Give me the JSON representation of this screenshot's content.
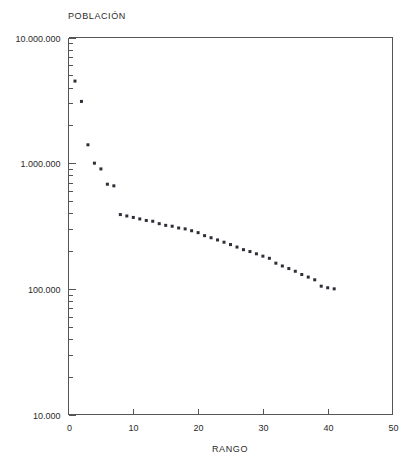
{
  "chart_data": {
    "type": "scatter",
    "title": "",
    "ylabel": "POBLACIÓN",
    "xlabel": "RANGO",
    "yscale": "log",
    "xscale": "linear",
    "xlim": [
      0,
      50
    ],
    "ylim": [
      10000,
      10000000
    ],
    "grid": false,
    "legend": null,
    "x_ticks": [
      0,
      10,
      20,
      30,
      40,
      50
    ],
    "x_tick_labels": [
      "0",
      "10",
      "20",
      "30",
      "40",
      "50"
    ],
    "y_ticks": [
      10000,
      100000,
      1000000,
      10000000
    ],
    "y_tick_labels": [
      "10.000",
      "100.000",
      "1.000.000",
      "10.000.000"
    ],
    "y_minor_ticks_per_decade": [
      2,
      3,
      4,
      5,
      6,
      7,
      8,
      9
    ],
    "marker": "square",
    "marker_color": "#2e2e38",
    "marker_size_px": 3,
    "series": [
      {
        "name": "POBLACIÓN por RANGO",
        "x": [
          1,
          2,
          3,
          4,
          5,
          6,
          7,
          8,
          9,
          10,
          11,
          12,
          13,
          14,
          15,
          16,
          17,
          18,
          19,
          20,
          21,
          22,
          23,
          24,
          25,
          26,
          27,
          28,
          29,
          30,
          31,
          32,
          33,
          34,
          35,
          36,
          37,
          38,
          39,
          40,
          41
        ],
        "y": [
          4500000,
          3100000,
          1400000,
          1000000,
          900000,
          680000,
          660000,
          390000,
          380000,
          370000,
          360000,
          350000,
          345000,
          330000,
          320000,
          315000,
          305000,
          300000,
          290000,
          280000,
          265000,
          255000,
          245000,
          235000,
          225000,
          215000,
          205000,
          198000,
          190000,
          182000,
          175000,
          160000,
          152000,
          145000,
          138000,
          130000,
          124000,
          118000,
          105000,
          102000,
          100000
        ]
      }
    ]
  },
  "axes": {
    "y_axis_title": "POBLACIÓN",
    "x_axis_title": "RANGO"
  }
}
